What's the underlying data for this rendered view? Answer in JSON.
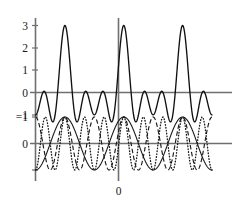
{
  "figure": {
    "title": "",
    "background": "#ffffff",
    "axis_color": "#6f6f6f",
    "curve_color": "#1a1a1a"
  },
  "chart_data": {
    "type": "line",
    "title": "",
    "xlabel": "",
    "ylabel": "",
    "grid": false,
    "legend": "none",
    "panels": [
      {
        "name": "sum-panel",
        "xlim": [
          -9.4248,
          9.4248
        ],
        "ylim": [
          -1.35,
          3.25
        ],
        "yticks": [
          -1,
          0,
          1,
          2,
          3
        ],
        "ytick_labels": [
          "−1",
          "0",
          "1",
          "2",
          "3"
        ],
        "xticks": [],
        "xtick_labels": [],
        "series": [
          {
            "name": "sum",
            "style": "solid",
            "formula": "cos(x) + cos(2x) + cos(3x)",
            "peak_value": 3,
            "peak_x": 0,
            "x_samples": [
              -9.4248,
              -8.0,
              -6.5,
              -5.2,
              -4.2,
              -3.14,
              -2.1,
              -1.0,
              0.0,
              1.0,
              2.1,
              3.14,
              4.2,
              5.2,
              6.5,
              8.0,
              9.4248
            ],
            "y_samples": [
              1.62,
              -0.47,
              0.58,
              -0.62,
              0.38,
              -1.0,
              -0.5,
              0.6,
              3.0,
              0.6,
              -0.5,
              -1.0,
              0.38,
              -0.62,
              0.58,
              -0.47,
              1.62
            ]
          }
        ]
      },
      {
        "name": "components-panel",
        "xlim": [
          -9.4248,
          9.4248
        ],
        "ylim": [
          -1.55,
          1.55
        ],
        "yticks": [
          0,
          1
        ],
        "ytick_labels": [
          "0",
          "−1"
        ],
        "xticks": [
          0
        ],
        "xtick_labels": [
          "0"
        ],
        "series": [
          {
            "name": "component-1",
            "style": "solid",
            "formula": "cos(x)",
            "amplitude": 1,
            "period": 6.2832
          },
          {
            "name": "component-2",
            "style": "dashed",
            "formula": "cos(2x)",
            "amplitude": 1,
            "period": 3.1416
          },
          {
            "name": "component-3",
            "style": "dotted",
            "formula": "cos(3x)",
            "amplitude": 1,
            "period": 2.0944
          }
        ]
      }
    ]
  },
  "labels": {
    "y_top": [
      "3",
      "2",
      "1",
      "0",
      "−1"
    ],
    "y_bottom": [
      "−1",
      "0"
    ],
    "x_center": "0"
  }
}
